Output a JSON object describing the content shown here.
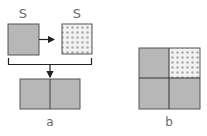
{
  "diagram": {
    "panel_a": {
      "label": "a",
      "source_square_label": "S",
      "target_square_label": "S",
      "source_fill": "gray",
      "target_fill": "dotted",
      "result": "two-half rectangle: gray | gray"
    },
    "panel_b": {
      "label": "b",
      "grid": [
        [
          "gray",
          "dotted"
        ],
        [
          "gray",
          "gray"
        ]
      ]
    }
  },
  "colors": {
    "gray_fill": "#b7b7b7",
    "stroke": "#555555",
    "dot_bg": "#f2f2f2",
    "dot": "#a8a8a8",
    "text": "#6a6a6a"
  }
}
